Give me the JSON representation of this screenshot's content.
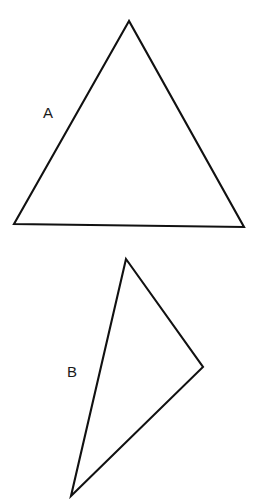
{
  "figure": {
    "canvas": {
      "width": 253,
      "height": 501
    },
    "background_color": "#ffffff",
    "stroke_color": "#111111",
    "fill_color": "#ffffff",
    "stroke_width": 2.1,
    "shapes": [
      {
        "id": "triangle-a",
        "name": "triangle-a",
        "type": "triangle",
        "label": "A",
        "label_position": {
          "x": 43,
          "y": 105
        },
        "points": "129,21 14,224 244,227",
        "vertices": [
          {
            "name": "apex",
            "x": 129,
            "y": 21
          },
          {
            "name": "bottom-left",
            "x": 14,
            "y": 224
          },
          {
            "name": "bottom-right",
            "x": 244,
            "y": 227
          }
        ]
      },
      {
        "id": "triangle-b",
        "name": "triangle-b",
        "type": "triangle",
        "label": "B",
        "label_position": {
          "x": 67,
          "y": 364
        },
        "points": "126,259 203,367 71,496",
        "vertices": [
          {
            "name": "top",
            "x": 126,
            "y": 259
          },
          {
            "name": "right",
            "x": 203,
            "y": 367
          },
          {
            "name": "bottom",
            "x": 71,
            "y": 496
          }
        ]
      }
    ]
  }
}
